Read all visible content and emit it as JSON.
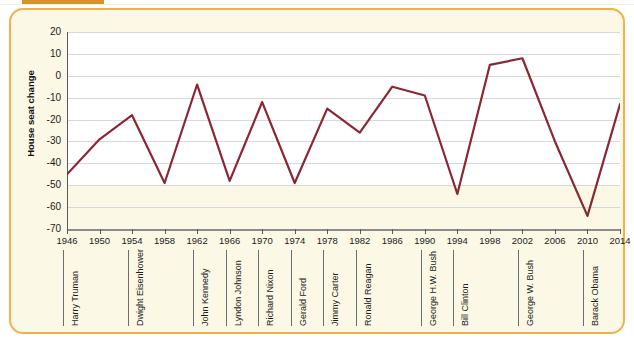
{
  "frame": {
    "header_bar_color": "#D9912B",
    "panel_bg": "#FBF8E6",
    "panel_border": "#EFB14A"
  },
  "chart_data": {
    "type": "line",
    "title": "",
    "xlabel": "",
    "ylabel": "House seat change",
    "line_color": "#8B2635",
    "grid": true,
    "legend": "none",
    "xlim": [
      1946,
      2014
    ],
    "ylim": [
      -70,
      20
    ],
    "ytick_step": 10,
    "xtick_step": 4,
    "yticks": [
      "20",
      "10",
      "0",
      "-10",
      "-20",
      "-30",
      "-40",
      "-50",
      "-60",
      "-70"
    ],
    "x": [
      1946,
      1950,
      1954,
      1958,
      1962,
      1966,
      1970,
      1974,
      1978,
      1982,
      1986,
      1990,
      1994,
      1998,
      2002,
      2006,
      2010,
      2014
    ],
    "xticks": [
      "1946",
      "1950",
      "1954",
      "1958",
      "1962",
      "1966",
      "1970",
      "1974",
      "1978",
      "1982",
      "1986",
      "1990",
      "1994",
      "1998",
      "2002",
      "2006",
      "2010",
      "2014"
    ],
    "values": [
      -45,
      -29,
      -18,
      -49,
      -4,
      -48,
      -12,
      -49,
      -15,
      -26,
      -5,
      -9,
      -54,
      5,
      8,
      -30,
      -64,
      -13
    ],
    "series": [
      {
        "name": "House seat change",
        "values": [
          -45,
          -29,
          -18,
          -49,
          -4,
          -48,
          -12,
          -49,
          -15,
          -26,
          -5,
          -9,
          -54,
          5,
          8,
          -30,
          -64,
          -13
        ]
      }
    ],
    "presidents": [
      {
        "name": "Harry Truman",
        "year": 1946
      },
      {
        "name": "Dwight Eisenhower",
        "year": 1954
      },
      {
        "name": "John Kennedy",
        "year": 1962
      },
      {
        "name": "Lyndon Johnson",
        "year": 1966
      },
      {
        "name": "Richard Nixon",
        "year": 1970
      },
      {
        "name": "Gerald Ford",
        "year": 1974
      },
      {
        "name": "Jimmy Carter",
        "year": 1978
      },
      {
        "name": "Ronald Reagan",
        "year": 1982
      },
      {
        "name": "George H.W. Bush",
        "year": 1990
      },
      {
        "name": "Bill Clinton",
        "year": 1994
      },
      {
        "name": "George W. Bush",
        "year": 2002
      },
      {
        "name": "Barack Obama",
        "year": 2010
      }
    ]
  }
}
